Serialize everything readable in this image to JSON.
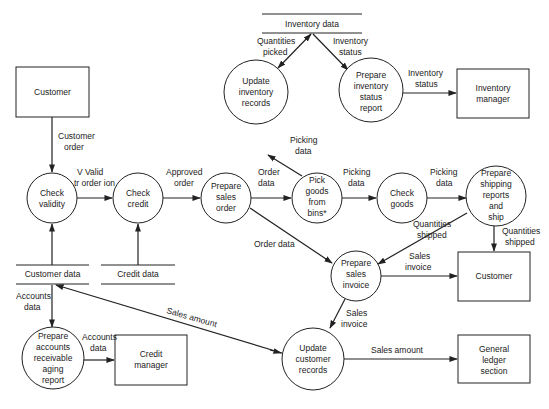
{
  "diagram": {
    "type": "data-flow-diagram",
    "entities": {
      "customer_top": {
        "label": [
          "Customer"
        ]
      },
      "inventory_manager": {
        "label": [
          "Inventory",
          "manager"
        ]
      },
      "credit_manager": {
        "label": [
          "Credit",
          "manager"
        ]
      },
      "customer_right": {
        "label": [
          "Customer"
        ]
      },
      "general_ledger": {
        "label": [
          "General",
          "ledger",
          "section"
        ]
      }
    },
    "processes": {
      "check_validity": {
        "label": [
          "Check",
          "validity"
        ]
      },
      "check_credit": {
        "label": [
          "Check",
          "credit"
        ]
      },
      "prepare_sales_order": {
        "label": [
          "Prepare",
          "sales",
          "order"
        ]
      },
      "pick_goods": {
        "label": [
          "Pick",
          "goods",
          "from",
          "bins*"
        ]
      },
      "check_goods": {
        "label": [
          "Check",
          "goods"
        ]
      },
      "prepare_shipping": {
        "label": [
          "Prepare",
          "shipping",
          "reports",
          "and",
          "ship"
        ]
      },
      "update_inventory": {
        "label": [
          "Update",
          "inventory",
          "records"
        ]
      },
      "prepare_inventory_report": {
        "label": [
          "Prepare",
          "inventory",
          "status",
          "report"
        ]
      },
      "prepare_sales_invoice": {
        "label": [
          "Prepare",
          "sales",
          "invoice"
        ]
      },
      "update_customer_records": {
        "label": [
          "Update",
          "customer",
          "records"
        ]
      },
      "prepare_ar_aging": {
        "label": [
          "Prepare",
          "accounts",
          "receivable",
          "aging",
          "report"
        ]
      }
    },
    "stores": {
      "inventory_data": {
        "label": "Inventory data"
      },
      "customer_data": {
        "label": "Customer data"
      },
      "credit_data": {
        "label": "Credit data"
      }
    },
    "flows": {
      "customer_order": {
        "label": [
          "Customer",
          "order"
        ]
      },
      "valid_order": {
        "label": [
          "V Valid",
          "tr order ion"
        ]
      },
      "approved_order": {
        "label": [
          "Approved",
          "order"
        ]
      },
      "order_data_1": {
        "label": [
          "Order",
          "data"
        ]
      },
      "order_data_2": {
        "label": [
          "Order data"
        ]
      },
      "picking_data_up": {
        "label": [
          "Picking",
          "data"
        ]
      },
      "picking_data_1": {
        "label": [
          "Picking",
          "data"
        ]
      },
      "picking_data_2": {
        "label": [
          "Picking",
          "data"
        ]
      },
      "quantities_picked": {
        "label": [
          "Quantities",
          "picked"
        ]
      },
      "inventory_status_1": {
        "label": [
          "Inventory",
          "status"
        ]
      },
      "inventory_status_2": {
        "label": [
          "Inventory",
          "status"
        ]
      },
      "quantities_shipped_1": {
        "label": [
          "Quantities",
          "shipped"
        ]
      },
      "quantities_shipped_2": {
        "label": [
          "Quantities",
          "shipped"
        ]
      },
      "sales_invoice_1": {
        "label": [
          "Sales",
          "invoice"
        ]
      },
      "sales_invoice_2": {
        "label": [
          "Sales",
          "invoice"
        ]
      },
      "sales_amount_1": {
        "label": [
          "Sales amount"
        ]
      },
      "sales_amount_2": {
        "label": [
          "Sales amount"
        ]
      },
      "accounts_data_1": {
        "label": [
          "Accounts",
          "data"
        ]
      },
      "accounts_data_2": {
        "label": [
          "Accounts",
          "data"
        ]
      }
    },
    "colors": {
      "ink": "#222222",
      "background": "#ffffff"
    }
  }
}
